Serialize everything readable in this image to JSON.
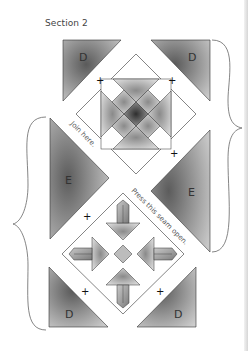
{
  "title": "Section 2",
  "pieces": {
    "top_left": "D",
    "top_right": "D",
    "middle_left": "E",
    "middle_right": "E",
    "bottom_left": "D",
    "bottom_right": "D"
  },
  "annotations": {
    "join": "Join here.",
    "press": "Press this seam open."
  },
  "join_marker": "+",
  "colors": {
    "piece_dark": "#555555",
    "piece_light": "#cfcfcf",
    "outline": "#333333",
    "brace": "#666666"
  }
}
